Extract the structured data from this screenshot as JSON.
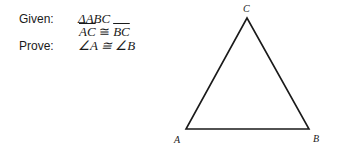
{
  "proof": {
    "given_label": "Given:",
    "given_line1": "ΔABC",
    "given_line2": {
      "left": "AC",
      "relation": " ≅ ",
      "right": "BC"
    },
    "prove_label": "Prove:",
    "prove_statement": "∠A ≅ ∠B"
  },
  "diagram": {
    "shape": "triangle",
    "vertices": {
      "A": {
        "label": "A",
        "x": 186,
        "y": 129
      },
      "B": {
        "label": "B",
        "x": 309,
        "y": 129
      },
      "C": {
        "label": "C",
        "x": 247,
        "y": 18
      }
    },
    "stroke_color": "#1a1a1a"
  }
}
